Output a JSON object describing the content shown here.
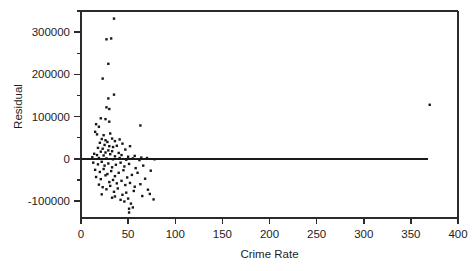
{
  "chart_data": {
    "type": "scatter",
    "title": "",
    "subtitle": "",
    "xlabel": "Crime Rate",
    "ylabel": "Residual",
    "xlim": [
      0,
      400
    ],
    "ylim": [
      -140000,
      350000
    ],
    "xticks": [
      0,
      50,
      100,
      150,
      200,
      250,
      300,
      350,
      400
    ],
    "xtick_labels": [
      "0",
      "50",
      "100",
      "150",
      "200",
      "250",
      "300",
      "350",
      "400"
    ],
    "yticks": [
      -100000,
      0,
      100000,
      200000,
      300000
    ],
    "ytick_labels": [
      "-100000",
      "0",
      "100000",
      "200000",
      "300000"
    ],
    "y_minor_ticks": [
      -50000,
      50000,
      150000,
      250000,
      350000
    ],
    "grid": false,
    "legend": null,
    "marker": "filled-square",
    "marker_size_px": 2.4,
    "marker_color": "#171717",
    "reference_line": {
      "type": "horizontal",
      "y": 0,
      "x_start": 0,
      "x_end": 368,
      "color": "#1a1a1a"
    },
    "points": [
      [
        35,
        332000
      ],
      [
        27,
        283000
      ],
      [
        32,
        285000
      ],
      [
        29,
        225000
      ],
      [
        23,
        190000
      ],
      [
        35,
        152000
      ],
      [
        29,
        143000
      ],
      [
        27,
        122000
      ],
      [
        30,
        118000
      ],
      [
        21,
        96000
      ],
      [
        26,
        94000
      ],
      [
        30,
        88000
      ],
      [
        16,
        82000
      ],
      [
        19,
        76000
      ],
      [
        63,
        79000
      ],
      [
        370,
        128000
      ],
      [
        15,
        64000
      ],
      [
        17,
        58000
      ],
      [
        24,
        56000
      ],
      [
        31,
        60000
      ],
      [
        22,
        47000
      ],
      [
        26,
        44000
      ],
      [
        33,
        48000
      ],
      [
        28,
        40000
      ],
      [
        20,
        38000
      ],
      [
        36,
        42000
      ],
      [
        41,
        46000
      ],
      [
        25,
        33000
      ],
      [
        30,
        30000
      ],
      [
        34,
        28000
      ],
      [
        18,
        26000
      ],
      [
        23,
        24000
      ],
      [
        38,
        31000
      ],
      [
        44,
        36000
      ],
      [
        52,
        30000
      ],
      [
        29,
        20000
      ],
      [
        21,
        17000
      ],
      [
        26,
        15000
      ],
      [
        33,
        18000
      ],
      [
        40,
        14000
      ],
      [
        47,
        22000
      ],
      [
        14,
        12000
      ],
      [
        17,
        9000
      ],
      [
        24,
        8000
      ],
      [
        31,
        11000
      ],
      [
        36,
        6000
      ],
      [
        43,
        9000
      ],
      [
        50,
        5000
      ],
      [
        57,
        7000
      ],
      [
        64,
        3000
      ],
      [
        12,
        4000
      ],
      [
        19,
        2000
      ],
      [
        27,
        1000
      ],
      [
        34,
        -1000
      ],
      [
        41,
        2000
      ],
      [
        48,
        -2000
      ],
      [
        55,
        1000
      ],
      [
        62,
        -3000
      ],
      [
        70,
        2000
      ],
      [
        78,
        -1000
      ],
      [
        13,
        -9000
      ],
      [
        18,
        -13000
      ],
      [
        22,
        -7000
      ],
      [
        25,
        -16000
      ],
      [
        29,
        -11000
      ],
      [
        33,
        -20000
      ],
      [
        37,
        -14000
      ],
      [
        42,
        -9000
      ],
      [
        46,
        -18000
      ],
      [
        51,
        -12000
      ],
      [
        58,
        -22000
      ],
      [
        66,
        -16000
      ],
      [
        74,
        -28000
      ],
      [
        15,
        -26000
      ],
      [
        20,
        -31000
      ],
      [
        24,
        -24000
      ],
      [
        28,
        -36000
      ],
      [
        32,
        -29000
      ],
      [
        36,
        -41000
      ],
      [
        40,
        -33000
      ],
      [
        45,
        -27000
      ],
      [
        49,
        -44000
      ],
      [
        54,
        -38000
      ],
      [
        60,
        -33000
      ],
      [
        68,
        -47000
      ],
      [
        16,
        -43000
      ],
      [
        21,
        -48000
      ],
      [
        26,
        -39000
      ],
      [
        30,
        -55000
      ],
      [
        34,
        -50000
      ],
      [
        38,
        -58000
      ],
      [
        43,
        -52000
      ],
      [
        47,
        -62000
      ],
      [
        52,
        -57000
      ],
      [
        57,
        -66000
      ],
      [
        63,
        -60000
      ],
      [
        71,
        -73000
      ],
      [
        19,
        -61000
      ],
      [
        23,
        -67000
      ],
      [
        27,
        -72000
      ],
      [
        31,
        -64000
      ],
      [
        35,
        -78000
      ],
      [
        39,
        -70000
      ],
      [
        44,
        -85000
      ],
      [
        48,
        -80000
      ],
      [
        56,
        -76000
      ],
      [
        65,
        -88000
      ],
      [
        73,
        -83000
      ],
      [
        22,
        -84000
      ],
      [
        33,
        -92000
      ],
      [
        42,
        -97000
      ],
      [
        50,
        -94000
      ],
      [
        53,
        -106000
      ],
      [
        51,
        -118000
      ],
      [
        55,
        -115000
      ],
      [
        77,
        -96000
      ],
      [
        36,
        -89000
      ],
      [
        46,
        -101000
      ],
      [
        51,
        -127000
      ]
    ]
  }
}
